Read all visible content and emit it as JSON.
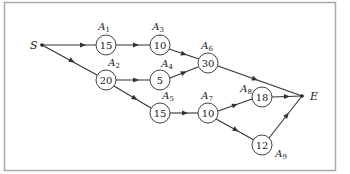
{
  "diagram": {
    "type": "activity-network",
    "start": {
      "label": "S"
    },
    "end": {
      "label": "E"
    },
    "nodes": [
      {
        "id": "A1",
        "letter": "A",
        "sub": "1",
        "value": "15"
      },
      {
        "id": "A2",
        "letter": "A",
        "sub": "2",
        "value": "20"
      },
      {
        "id": "A3",
        "letter": "A",
        "sub": "3",
        "value": "10"
      },
      {
        "id": "A4",
        "letter": "A",
        "sub": "4",
        "value": "5"
      },
      {
        "id": "A5",
        "letter": "A",
        "sub": "5",
        "value": "15"
      },
      {
        "id": "A6",
        "letter": "A",
        "sub": "6",
        "value": "30"
      },
      {
        "id": "A7",
        "letter": "A",
        "sub": "7",
        "value": "10"
      },
      {
        "id": "A8",
        "letter": "A",
        "sub": "8",
        "value": "18"
      },
      {
        "id": "A9",
        "letter": "A",
        "sub": "9",
        "value": "12"
      }
    ],
    "edges": [
      [
        "S",
        "A1"
      ],
      [
        "S",
        "A2"
      ],
      [
        "A1",
        "A3"
      ],
      [
        "A2",
        "A4"
      ],
      [
        "A2",
        "A5"
      ],
      [
        "A3",
        "A6"
      ],
      [
        "A4",
        "A6"
      ],
      [
        "A5",
        "A7"
      ],
      [
        "A6",
        "E"
      ],
      [
        "A7",
        "A8"
      ],
      [
        "A7",
        "A9"
      ],
      [
        "A8",
        "E"
      ],
      [
        "A9",
        "E"
      ]
    ]
  }
}
